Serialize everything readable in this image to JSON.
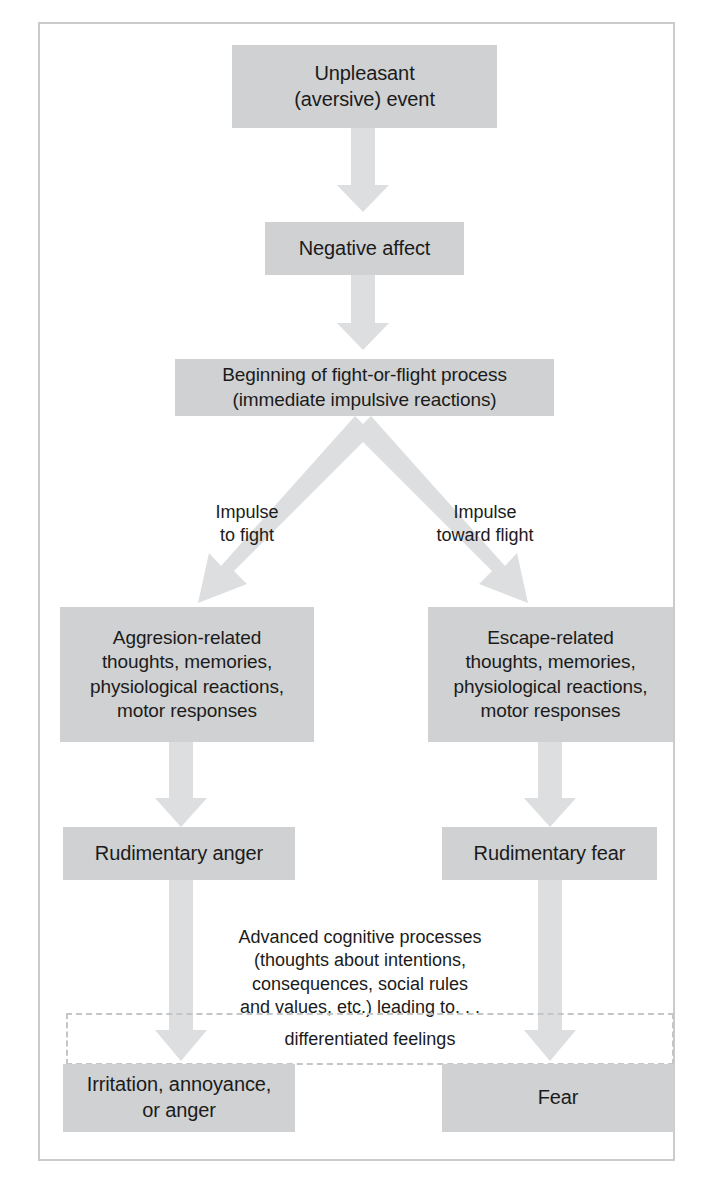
{
  "diagram": {
    "accent_box_color": "#cfd1d2",
    "arrow_color": "#dcdedf",
    "frame_color": "#c9cbcd",
    "text_color": "#1b1b1b",
    "nodes": {
      "unpleasant_event": "Unpleasant\n(aversive) event",
      "negative_affect": "Negative affect",
      "fight_or_flight": "Beginning of fight-or-flight process\n(immediate impulsive reactions)",
      "aggression_related": "Aggresion-related\nthoughts, memories,\nphysiological reactions,\nmotor responses",
      "escape_related": "Escape-related\nthoughts, memories,\nphysiological reactions,\nmotor responses",
      "rudimentary_anger": "Rudimentary anger",
      "rudimentary_fear": "Rudimentary fear",
      "irritation_annoyance_anger": "Irritation, annoyance,\nor anger",
      "fear": "Fear"
    },
    "edge_labels": {
      "impulse_to_fight": "Impulse\nto fight",
      "impulse_toward_flight": "Impulse\ntoward flight"
    },
    "annotations": {
      "advanced_cognitive": "Advanced cognitive processes\n(thoughts about intentions,\nconsequences, social rules\nand values, etc.) leading to. . .",
      "differentiated_feelings": "differentiated feelings"
    }
  }
}
